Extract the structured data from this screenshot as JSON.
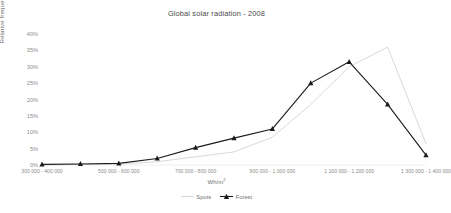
{
  "chart_data": {
    "type": "line",
    "title": "Global solar radiation - 2008",
    "xlabel": "Wh/m²",
    "ylabel": "Relative frequency",
    "grid": false,
    "legend_position": "bottom",
    "ylim": [
      0,
      40
    ],
    "yticks": [
      0,
      5,
      10,
      15,
      20,
      25,
      30,
      35,
      40
    ],
    "ytick_labels": [
      "0%",
      "5%",
      "10%",
      "15%",
      "20%",
      "25%",
      "30%",
      "35%",
      "40%"
    ],
    "categories": [
      "300 000 - 400 000",
      "400 000 - 500 000",
      "500 000 - 600 000",
      "600 000 - 700 000",
      "700 000 - 800 000",
      "800 000 - 900 000",
      "900 000 - 1 000 000",
      "1 000 000 - 1 100 000",
      "1 100 000 - 1 200 000",
      "1 200 000 - 1 300 000",
      "1 300 000 - 1 400 000"
    ],
    "xtick_labels_shown": [
      "300 000 - 400 000",
      "500 000 - 600 000",
      "700 000 - 800 000",
      "900 000 - 1 000 000",
      "1 100 000 - 1 200 000",
      "1 300 000 - 1 400 000"
    ],
    "series": [
      {
        "name": "Spots",
        "color": "#d9d9d9",
        "marker": "none",
        "values": [
          0.0,
          0.2,
          0.3,
          1.0,
          2.5,
          4.0,
          8.5,
          18.5,
          30.0,
          36.0,
          6.5
        ]
      },
      {
        "name": "Forest",
        "color": "#1a1a1a",
        "marker": "triangle",
        "values": [
          0.2,
          0.3,
          0.5,
          2.0,
          5.3,
          8.2,
          11.0,
          25.0,
          31.5,
          18.5,
          3.0
        ]
      }
    ]
  }
}
